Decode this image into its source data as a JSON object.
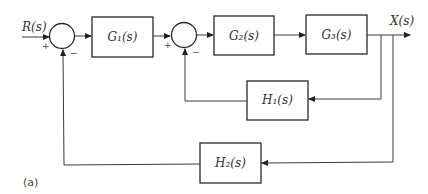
{
  "diagram": {
    "type": "block-diagram",
    "caption": "(a)",
    "input": {
      "label": "R(s)"
    },
    "output": {
      "label": "X(s)"
    },
    "summing_junctions": [
      {
        "id": "sum1",
        "signs": {
          "left": "+",
          "bottom": "−"
        }
      },
      {
        "id": "sum2",
        "signs": {
          "left": "+",
          "bottom": "−"
        }
      }
    ],
    "blocks": [
      {
        "id": "G1",
        "label": "G₁(s)"
      },
      {
        "id": "G2",
        "label": "G₂(s)"
      },
      {
        "id": "G3",
        "label": "G₃(s)"
      },
      {
        "id": "H1",
        "label": "H₁(s)"
      },
      {
        "id": "H2",
        "label": "H₂(s)"
      }
    ],
    "connections": [
      {
        "from": "R(s)",
        "to": "sum1"
      },
      {
        "from": "sum1",
        "to": "G1"
      },
      {
        "from": "G1",
        "to": "sum2"
      },
      {
        "from": "sum2",
        "to": "G2"
      },
      {
        "from": "G2",
        "to": "G3"
      },
      {
        "from": "G3",
        "to": "X(s)"
      },
      {
        "from": "X(s)",
        "to": "H1"
      },
      {
        "from": "H1",
        "to": "sum2",
        "sign": "−"
      },
      {
        "from": "X(s)",
        "to": "H2"
      },
      {
        "from": "H2",
        "to": "sum1",
        "sign": "−"
      }
    ]
  }
}
